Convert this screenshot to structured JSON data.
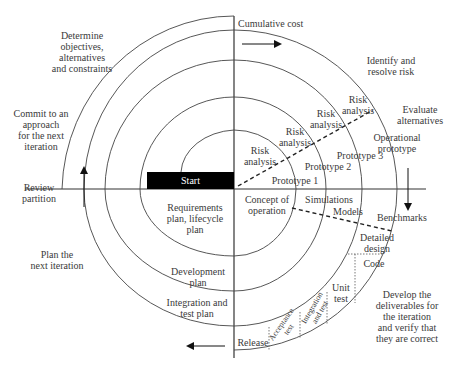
{
  "diagram": {
    "axes": {
      "vertical_label": "Cumulative cost",
      "horizontal_label": "Review partition"
    },
    "start_label": "Start",
    "quadrants": {
      "top_left": "Determine\nobjectives,\nalternatives\nand constraints",
      "top_right": "Identify and\nresolve risk",
      "bottom_right": "Develop the\ndeliverables for\nthe iteration\nand verify that\nthey are correct",
      "bottom_left": "Plan the\nnext iteration"
    },
    "side_labels": {
      "commit": "Commit to an\napproach\nfor the next\niteration",
      "evaluate": "Evaluate\nalternatives",
      "review": "Review\npartition"
    },
    "risk_analysis": [
      "Risk\nanalysis",
      "Risk\nanalysis",
      "Risk\nanalysis",
      "Risk\nanalysis"
    ],
    "prototypes": [
      "Prototype 1",
      "Prototype 2",
      "Prototype 3",
      "Operational\nprototype"
    ],
    "plans": [
      "Requirements\nplan, lifecycle\nplan",
      "Development\nplan",
      "Integration and\ntest plan"
    ],
    "development": {
      "concept": "Concept of\noperation",
      "simulations": "Simulations",
      "models": "Models",
      "benchmarks": "Benchmarks",
      "detailed_design": "Detailed\ndesign",
      "code": "Code",
      "unit_test": "Unit\ntest",
      "integration_test": "Integration\nand test",
      "acceptance_test": "Acceptance\ntest",
      "release": "Release"
    },
    "colors": {
      "line": "#333333",
      "start_fill": "#000000",
      "start_text": "#ffffff"
    }
  }
}
